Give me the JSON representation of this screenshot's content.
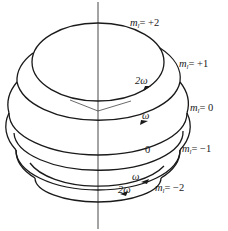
{
  "diagram": {
    "type": "vector-model-orbital-angular-momentum-precession",
    "axis": "z-axis (vertical)",
    "levels": [
      {
        "m_l": "+2",
        "label_var": "m",
        "label_sub": "l",
        "label_value": "= +2",
        "frequency_label": "2ω",
        "direction": "counterclockwise-front-right"
      },
      {
        "m_l": "+1",
        "label_var": "m",
        "label_sub": "l",
        "label_value": "= +1",
        "frequency_label": "",
        "direction": ""
      },
      {
        "m_l": "0",
        "label_var": "m",
        "label_sub": "l",
        "label_value": "= 0",
        "frequency_label": "ω",
        "direction": "counterclockwise-front-right"
      },
      {
        "m_l": "-1",
        "label_var": "m",
        "label_sub": "l",
        "label_value": "= −1",
        "frequency_label": "0",
        "direction": "none"
      },
      {
        "m_l": "-2",
        "label_var": "m",
        "label_sub": "l",
        "label_value": "= −2",
        "frequency_label": "ω",
        "direction": "clockwise-front-left"
      }
    ],
    "extra_labels": {
      "omega_bottom": "2ω"
    },
    "colors": {
      "stroke": "#1a1a1a",
      "background": "#ffffff"
    }
  }
}
